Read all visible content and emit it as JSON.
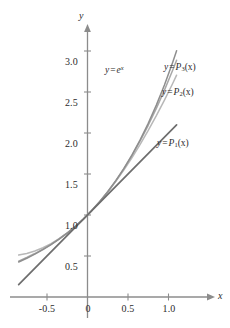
{
  "chart_data": {
    "type": "line",
    "title": "",
    "xlabel": "x",
    "ylabel": "y",
    "xlim": [
      -0.85,
      1.22
    ],
    "ylim": [
      -0.12,
      3.22
    ],
    "grid": false,
    "legend_position": "inline-annotations",
    "xticks": [
      -0.5,
      0,
      0.5,
      1.0
    ],
    "xticklabels": [
      "-0.5",
      "0",
      "0.5",
      "1.0"
    ],
    "yticks": [
      0.5,
      1.0,
      1.5,
      2.0,
      2.5,
      3.0
    ],
    "yticklabels": [
      "0.5",
      "1.0",
      "1.5",
      "2.0",
      "2.5",
      "3.0"
    ],
    "series": [
      {
        "name": "y = e^x",
        "label_text": "y = e",
        "label_sup": "x",
        "color": "#8e8e8e",
        "x": [
          -0.85,
          -0.75,
          -0.65,
          -0.55,
          -0.45,
          -0.35,
          -0.25,
          -0.15,
          -0.05,
          0.05,
          0.15,
          0.25,
          0.35,
          0.45,
          0.55,
          0.65,
          0.75,
          0.85,
          0.95,
          1.05,
          1.1
        ],
        "values": [
          0.427,
          0.472,
          0.522,
          0.577,
          0.638,
          0.705,
          0.779,
          0.861,
          0.951,
          1.051,
          1.162,
          1.284,
          1.419,
          1.568,
          1.733,
          1.916,
          2.117,
          2.34,
          2.586,
          2.858,
          3.004
        ]
      },
      {
        "name": "y = P3(x)",
        "label_text": "y = P",
        "label_sub": "3",
        "label_arg": "(x)",
        "color": "#a8a8a8",
        "x": [
          -0.85,
          -0.75,
          -0.65,
          -0.55,
          -0.45,
          -0.35,
          -0.25,
          -0.15,
          -0.05,
          0.05,
          0.15,
          0.25,
          0.35,
          0.45,
          0.55,
          0.65,
          0.75,
          0.85,
          0.95,
          1.05,
          1.1
        ],
        "values": [
          0.438,
          0.482,
          0.53,
          0.583,
          0.642,
          0.708,
          0.781,
          0.862,
          0.951,
          1.051,
          1.162,
          1.284,
          1.418,
          1.566,
          1.728,
          1.903,
          2.094,
          2.3,
          2.523,
          2.762,
          2.887
        ]
      },
      {
        "name": "y = P2(x)",
        "label_text": "y = P",
        "label_sub": "2",
        "label_arg": "(x)",
        "color": "#b8b8b8",
        "x": [
          -0.85,
          -0.75,
          -0.65,
          -0.55,
          -0.45,
          -0.35,
          -0.25,
          -0.15,
          -0.05,
          0.05,
          0.15,
          0.25,
          0.35,
          0.45,
          0.55,
          0.65,
          0.75,
          0.85,
          0.95,
          1.05,
          1.1
        ],
        "values": [
          0.511,
          0.531,
          0.561,
          0.601,
          0.651,
          0.711,
          0.781,
          0.861,
          0.951,
          1.051,
          1.161,
          1.281,
          1.411,
          1.551,
          1.701,
          1.861,
          2.031,
          2.211,
          2.401,
          2.601,
          2.705
        ]
      },
      {
        "name": "y = P1(x)",
        "label_text": "y = P",
        "label_sub": "1",
        "label_arg": "(x)",
        "color": "#6e6e6e",
        "x": [
          -0.85,
          1.1
        ],
        "values": [
          0.15,
          2.1
        ]
      }
    ],
    "annotations": [
      {
        "id": "ann-ex",
        "text": "y = e^x",
        "x_px": 136,
        "y_px": 64
      },
      {
        "id": "ann-p3",
        "text": "y = P3(x)",
        "x_px": 165,
        "y_px": 63
      },
      {
        "id": "ann-p2",
        "text": "y = P2(x)",
        "x_px": 163,
        "y_px": 88
      },
      {
        "id": "ann-p1",
        "text": "y = P1(x)",
        "x_px": 158,
        "y_px": 139
      }
    ]
  },
  "axes": {
    "x_axis_label": "x",
    "y_axis_label": "y",
    "axis_color": "#8c8c8c"
  },
  "labels": {
    "y_3_0": "3.0",
    "y_2_5": "2.5",
    "y_2_0": "2.0",
    "y_1_5": "1.5",
    "y_1_0": "1.0",
    "y_0_5": "0.5",
    "x_neg_0_5": "-0.5",
    "x_0": "0",
    "x_0_5": "0.5",
    "x_1_0": "1.0"
  },
  "curve_labels": {
    "exp": {
      "prefix": "y",
      "op": "=",
      "base": "e",
      "exponent": "x"
    },
    "p3": {
      "prefix": "y",
      "op": "=",
      "base": "P",
      "sub": "3",
      "arg": "(x)"
    },
    "p2": {
      "prefix": "y",
      "op": "=",
      "base": "P",
      "sub": "2",
      "arg": "(x)"
    },
    "p1": {
      "prefix": "y",
      "op": "=",
      "base": "P",
      "sub": "1",
      "arg": "(x)"
    }
  }
}
